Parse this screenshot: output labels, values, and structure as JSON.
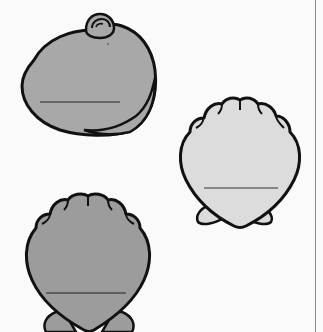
{
  "worksheet": {
    "shells": [
      {
        "type": "clam",
        "fill": "#a8a8a8",
        "label": ""
      },
      {
        "type": "scallop",
        "fill": "#dcdcdc",
        "label": ""
      },
      {
        "type": "scallop",
        "fill": "#9c9c9c",
        "label": ""
      }
    ],
    "stroke": "#111111",
    "background": "#fafafa"
  }
}
